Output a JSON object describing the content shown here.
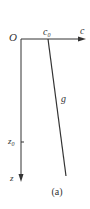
{
  "diagram": {
    "origin_label": "O",
    "x_axis_label": "c",
    "x_tick_label": "c",
    "x_tick_sub": "0",
    "y_axis_label": "z",
    "y_tick_label": "z",
    "y_tick_sub": "0",
    "curve_label": "g",
    "caption": "(a)",
    "colors": {
      "stroke": "#333333",
      "background": "#ffffff"
    }
  }
}
